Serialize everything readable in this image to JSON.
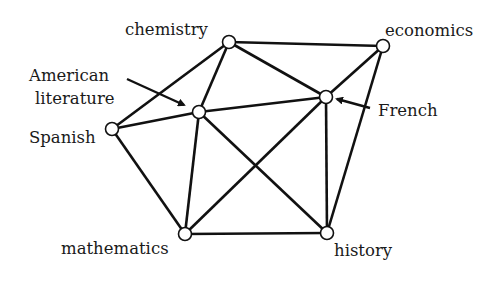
{
  "diagram": {
    "type": "undirected-graph",
    "nodes": [
      {
        "id": "chemistry",
        "label": "chemistry",
        "x": 229,
        "y": 42
      },
      {
        "id": "economics",
        "label": "economics",
        "x": 383,
        "y": 46
      },
      {
        "id": "amlit",
        "label": "American literature",
        "label_line1": "American",
        "label_line2": "literature",
        "x": 199,
        "y": 112
      },
      {
        "id": "french",
        "label": "French",
        "x": 326,
        "y": 97
      },
      {
        "id": "spanish",
        "label": "Spanish",
        "x": 112,
        "y": 129
      },
      {
        "id": "mathematics",
        "label": "mathematics",
        "x": 185,
        "y": 234
      },
      {
        "id": "history",
        "label": "history",
        "x": 327,
        "y": 233
      }
    ],
    "edges": [
      [
        "chemistry",
        "economics"
      ],
      [
        "chemistry",
        "spanish"
      ],
      [
        "chemistry",
        "amlit"
      ],
      [
        "chemistry",
        "french"
      ],
      [
        "economics",
        "french"
      ],
      [
        "economics",
        "history"
      ],
      [
        "spanish",
        "amlit"
      ],
      [
        "spanish",
        "mathematics"
      ],
      [
        "amlit",
        "french"
      ],
      [
        "amlit",
        "mathematics"
      ],
      [
        "amlit",
        "history"
      ],
      [
        "french",
        "mathematics"
      ],
      [
        "french",
        "history"
      ],
      [
        "mathematics",
        "history"
      ]
    ],
    "labels": {
      "chemistry": "chemistry",
      "economics": "economics",
      "amlit_line1": "American",
      "amlit_line2": "literature",
      "french": "French",
      "spanish": "Spanish",
      "mathematics": "mathematics",
      "history": "history"
    }
  }
}
